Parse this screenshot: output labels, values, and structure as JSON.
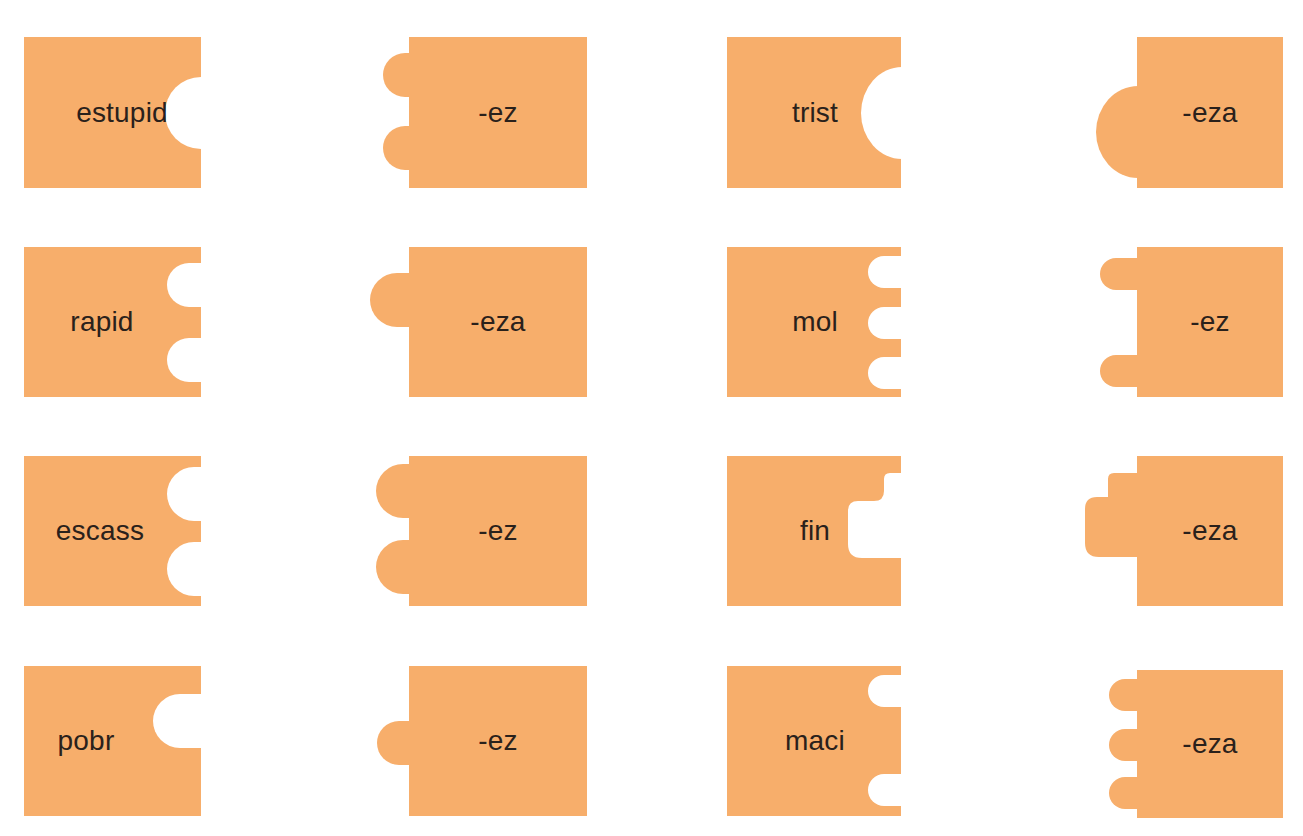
{
  "colors": {
    "piece_fill": "#f7ae6b",
    "background": "#ffffff",
    "text": "#2a211b"
  },
  "pieces": [
    {
      "label": "estupid",
      "x": 24,
      "y": 37,
      "w": 177,
      "h": 151,
      "side": "right",
      "shape": "socket",
      "knobs": [
        {
          "cy": 76,
          "r": 36
        }
      ],
      "tx": 98
    },
    {
      "label": "-ez",
      "x": 409,
      "y": 37,
      "w": 178,
      "h": 151,
      "side": "left",
      "shape": "tab",
      "knobs": [
        {
          "cy": 38,
          "r": 22,
          "ext": 26
        },
        {
          "cy": 111,
          "r": 22,
          "ext": 26
        }
      ],
      "tx": 89
    },
    {
      "label": "trist",
      "x": 727,
      "y": 37,
      "w": 174,
      "h": 151,
      "side": "right",
      "shape": "socket",
      "knobs": [
        {
          "cy": 76,
          "r": 46,
          "ext": 40
        }
      ],
      "tx": 88
    },
    {
      "label": "-eza",
      "x": 1137,
      "y": 37,
      "w": 146,
      "h": 151,
      "side": "left",
      "shape": "tab",
      "knobs": [
        {
          "cy": 95,
          "r": 46,
          "ext": 41
        }
      ],
      "tx": 73
    },
    {
      "label": "rapid",
      "x": 24,
      "y": 247,
      "w": 177,
      "h": 150,
      "side": "right",
      "shape": "socket",
      "knobs": [
        {
          "cy": 38,
          "r": 22,
          "ext": 34
        },
        {
          "cy": 113,
          "r": 22,
          "ext": 34
        }
      ],
      "tx": 78
    },
    {
      "label": "-eza",
      "x": 409,
      "y": 247,
      "w": 178,
      "h": 150,
      "side": "left",
      "shape": "tab",
      "knobs": [
        {
          "cy": 53,
          "r": 27,
          "ext": 39
        }
      ],
      "tx": 89
    },
    {
      "label": "mol",
      "x": 727,
      "y": 247,
      "w": 174,
      "h": 150,
      "side": "right",
      "shape": "socket",
      "knobs": [
        {
          "cy": 25,
          "r": 16,
          "ext": 33
        },
        {
          "cy": 76,
          "r": 16,
          "ext": 33
        },
        {
          "cy": 126,
          "r": 16,
          "ext": 33
        }
      ],
      "tx": 88
    },
    {
      "label": "-ez",
      "x": 1137,
      "y": 247,
      "w": 146,
      "h": 150,
      "side": "left",
      "shape": "tab",
      "knobs": [
        {
          "cy": 27,
          "r": 16,
          "ext": 37
        },
        {
          "cy": 124,
          "r": 16,
          "ext": 37
        }
      ],
      "tx": 73
    },
    {
      "label": "escass",
      "x": 24,
      "y": 456,
      "w": 177,
      "h": 150,
      "side": "right",
      "shape": "socket",
      "knobs": [
        {
          "cy": 38,
          "r": 27,
          "ext": 34
        },
        {
          "cy": 113,
          "r": 27,
          "ext": 34
        }
      ],
      "tx": 76
    },
    {
      "label": "-ez",
      "x": 409,
      "y": 456,
      "w": 178,
      "h": 150,
      "side": "left",
      "shape": "tab",
      "knobs": [
        {
          "cy": 35,
          "r": 27,
          "ext": 33
        },
        {
          "cy": 111,
          "r": 27,
          "ext": 33
        }
      ],
      "tx": 89
    },
    {
      "label": "fin",
      "x": 727,
      "y": 456,
      "w": 174,
      "h": 150,
      "side": "right",
      "shape": "step-socket",
      "knobs": [
        {
          "top": 17,
          "bottom": 102,
          "ext": 54,
          "step": 18,
          "stepTop": 17,
          "stepBottom": 45
        }
      ],
      "tx": 88
    },
    {
      "label": "-eza",
      "x": 1137,
      "y": 456,
      "w": 146,
      "h": 150,
      "side": "left",
      "shape": "step-tab",
      "knobs": [
        {
          "top": 41,
          "bottom": 101,
          "ext": 53,
          "step": 30,
          "stepTop": 17,
          "stepBottom": 41
        }
      ],
      "tx": 73
    },
    {
      "label": "pobr",
      "x": 24,
      "y": 666,
      "w": 177,
      "h": 150,
      "side": "right",
      "shape": "socket",
      "knobs": [
        {
          "cy": 55,
          "r": 27,
          "ext": 48
        }
      ],
      "tx": 62
    },
    {
      "label": "-ez",
      "x": 409,
      "y": 666,
      "w": 178,
      "h": 150,
      "side": "left",
      "shape": "tab",
      "knobs": [
        {
          "cy": 77,
          "r": 22,
          "ext": 32
        }
      ],
      "tx": 89
    },
    {
      "label": "maci",
      "x": 727,
      "y": 666,
      "w": 174,
      "h": 150,
      "side": "right",
      "shape": "socket",
      "knobs": [
        {
          "cy": 25,
          "r": 16,
          "ext": 33
        },
        {
          "cy": 124,
          "r": 16,
          "ext": 33
        }
      ],
      "tx": 88
    },
    {
      "label": "-eza",
      "x": 1137,
      "y": 670,
      "w": 146,
      "h": 148,
      "side": "left",
      "shape": "tab",
      "knobs": [
        {
          "cy": 25,
          "r": 16,
          "ext": 28
        },
        {
          "cy": 75,
          "r": 16,
          "ext": 28
        },
        {
          "cy": 123,
          "r": 16,
          "ext": 28
        }
      ],
      "tx": 73
    }
  ]
}
